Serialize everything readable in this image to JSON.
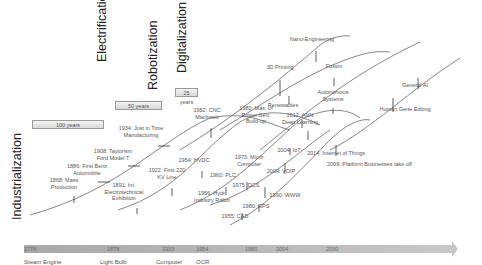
{
  "eras": [
    {
      "label": "Industrialization",
      "x": 10,
      "y": 220
    },
    {
      "label": "Electrification",
      "x": 95,
      "y": 62
    },
    {
      "label": "Robotization",
      "x": 146,
      "y": 90
    },
    {
      "label": "Digitalization",
      "x": 175,
      "y": 73
    }
  ],
  "spans": [
    {
      "label": "100 years",
      "x": 32,
      "y": 120,
      "w": 72
    },
    {
      "label": "50 years",
      "x": 115,
      "y": 101,
      "w": 47
    },
    {
      "label": "25 years",
      "x": 175,
      "y": 88,
      "w": 23
    }
  ],
  "timeline": {
    "ticks": [
      {
        "label": "1776",
        "x": 24
      },
      {
        "label": "1878",
        "x": 107
      },
      {
        "label": "1933",
        "x": 162
      },
      {
        "label": "1954",
        "x": 196
      },
      {
        "label": "1980",
        "x": 245
      },
      {
        "label": "2004",
        "x": 276
      },
      {
        "label": "2030",
        "x": 326
      }
    ],
    "below": [
      {
        "label": "Steam Engine",
        "x": 24
      },
      {
        "label": "Light Bulb",
        "x": 100
      },
      {
        "label": "Computer",
        "x": 156
      },
      {
        "label": "OCR",
        "x": 196
      }
    ]
  },
  "milestones": [
    {
      "label": "1868: Mass\nProduction",
      "x": 64,
      "y": 185
    },
    {
      "label": "1886: First Benz\nAutomobile",
      "x": 87,
      "y": 171
    },
    {
      "label": "1908: Taylorism\nFord Model T",
      "x": 113,
      "y": 156
    },
    {
      "label": "1934: Just in Time\nManufacturing",
      "x": 141,
      "y": 133
    },
    {
      "label": "1891: Int.\nElectrotechnical\nExhibition",
      "x": 124,
      "y": 190
    },
    {
      "label": "1922: First 220\nKV Line",
      "x": 167,
      "y": 175
    },
    {
      "label": "1952: CNC\nMachines",
      "x": 207,
      "y": 115
    },
    {
      "label": "1954: HVDC",
      "x": 194,
      "y": 165
    },
    {
      "label": "1956: Hydr.\nIndustry Robot",
      "x": 212,
      "y": 198
    },
    {
      "label": "1960: PLC",
      "x": 223,
      "y": 180
    },
    {
      "label": "1973: Micro\nComputer",
      "x": 249,
      "y": 162
    },
    {
      "label": "1975: DCS",
      "x": 246,
      "y": 190
    },
    {
      "label": "1955: CAD",
      "x": 235,
      "y": 221
    },
    {
      "label": "1980: GPS",
      "x": 256,
      "y": 211
    },
    {
      "label": "1990: WWW",
      "x": 285,
      "y": 200
    },
    {
      "label": "1980: Mas. of\nPower Gen.\nBuild-up",
      "x": 256,
      "y": 113
    },
    {
      "label": "Renewables",
      "x": 283,
      "y": 110
    },
    {
      "label": "3D Printing",
      "x": 280,
      "y": 72
    },
    {
      "label": "Nano-Engineering",
      "x": 312,
      "y": 44
    },
    {
      "label": "Fusion",
      "x": 334,
      "y": 71
    },
    {
      "label": "Autonomous\nSystems",
      "x": 333,
      "y": 97
    },
    {
      "label": "2012: ANN\nDeep Learning",
      "x": 300,
      "y": 120
    },
    {
      "label": "2004: IoT",
      "x": 289,
      "y": 155
    },
    {
      "label": "2004: VOIP",
      "x": 281,
      "y": 176
    },
    {
      "label": "2014: Internet of Things",
      "x": 336,
      "y": 158
    },
    {
      "label": "2009: Platform Businesses take off",
      "x": 357,
      "y": 169
    },
    {
      "label": "General AI",
      "x": 415,
      "y": 90
    },
    {
      "label": "Human Gene Editing",
      "x": 405,
      "y": 114
    }
  ]
}
